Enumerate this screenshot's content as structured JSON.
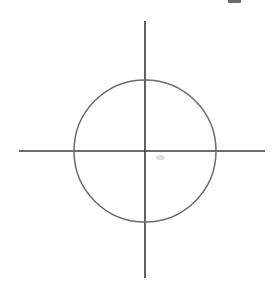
{
  "figure": {
    "background_color": "#ffffff",
    "width": 273,
    "height": 281,
    "origin": {
      "x": 145,
      "y": 151
    },
    "circle": {
      "label": "circle",
      "center_x": 145,
      "center_y": 151,
      "radius": 71,
      "stroke_color": "#6b6b70",
      "stroke_width": 1.5,
      "fill": "none",
      "leftmost_x": 74,
      "rightmost_x": 216,
      "topmost_y": 80,
      "bottommost_y": 222
    },
    "horizontal_axis": {
      "label": "horizontal axis",
      "x1": 19,
      "y1": 151,
      "x2": 265,
      "y2": 151,
      "stroke_color": "#3a3a3d",
      "stroke_width": 1.6
    },
    "vertical_axis": {
      "label": "vertical axis",
      "x1": 145,
      "y1": 21,
      "x2": 145,
      "y2": 278,
      "stroke_color": "#3a3a3d",
      "stroke_width": 1.6
    },
    "artifacts": {
      "top_ink_fragment": "partial ink mark clipped by the top edge of the scan",
      "center_smudge": "faint gray smudge just below the horizontal axis, right of the origin"
    }
  }
}
